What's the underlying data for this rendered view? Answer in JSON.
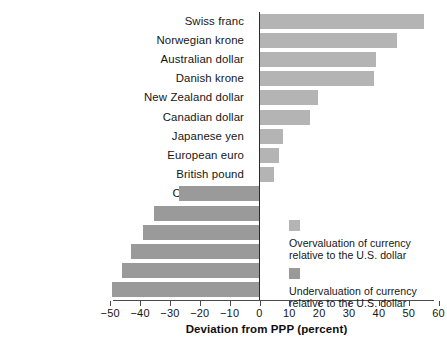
{
  "chart_data": {
    "type": "bar",
    "orientation": "horizontal",
    "title": "",
    "xlabel": "Deviation from PPP (percent)",
    "ylabel": "",
    "xlim": [
      -50,
      63
    ],
    "xticks": [
      -50,
      -40,
      -30,
      -20,
      -10,
      0,
      10,
      20,
      30,
      40,
      50,
      60
    ],
    "xtick_labels": [
      "−50",
      "−40",
      "−30",
      "−20",
      "−10",
      "0",
      "10",
      "20",
      "30",
      "40",
      "50",
      "60"
    ],
    "grid": false,
    "categories": [
      "Swiss franc",
      "Norwegian krone",
      "Australian dollar",
      "Danish krone",
      "New Zealand dollar",
      "Canadian dollar",
      "Japanese yen",
      "European euro",
      "British pound",
      "Czech koruna",
      "Mexican peso",
      "Polish zloty",
      "Russian ruble",
      "South African rand",
      "Turkish lira"
    ],
    "values": [
      55,
      46,
      39,
      38.5,
      19.5,
      17,
      8,
      6.5,
      5,
      -27,
      -35.5,
      -39,
      -43,
      -46,
      -49.5
    ],
    "bar_color_over": "#b4b4b4",
    "bar_color_under": "#9a9a9a",
    "legend": {
      "position": "inside-right",
      "entries": [
        {
          "key": "over",
          "line1": "Overvaluation of currency",
          "line2": "relative to the U.S. dollar",
          "color": "#b4b4b4"
        },
        {
          "key": "under",
          "line1": "Undervaluation of currency",
          "line2": "relative to the U.S. dollar",
          "color": "#9a9a9a"
        }
      ]
    }
  }
}
